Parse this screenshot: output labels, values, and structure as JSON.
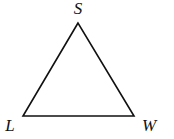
{
  "diagram": {
    "type": "triangle",
    "stroke_color": "#111111",
    "vertices": [
      {
        "id": "S",
        "label": "S",
        "x": 78,
        "y": 23,
        "label_x": 78,
        "label_y": 14
      },
      {
        "id": "L",
        "label": "L",
        "x": 23,
        "y": 116,
        "label_x": 10,
        "label_y": 131
      },
      {
        "id": "W",
        "label": "W",
        "x": 134,
        "y": 116,
        "label_x": 149,
        "label_y": 131
      }
    ],
    "sides": [
      "SL",
      "LW",
      "WS"
    ]
  }
}
